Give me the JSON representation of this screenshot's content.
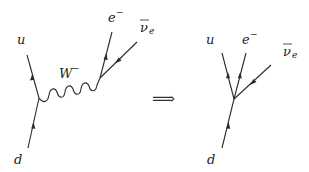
{
  "diagrams": {
    "left": {
      "title": "Beta decay via W boson exchange",
      "labels": {
        "u": "u",
        "d": "d",
        "W": "W",
        "W_charge": "−",
        "e": "e",
        "e_charge": "−",
        "nu": "ν",
        "nu_sub": "e"
      }
    },
    "arrow": "⟹",
    "right": {
      "title": "Effective four-fermion contact interaction",
      "labels": {
        "u": "u",
        "d": "d",
        "e": "e",
        "e_charge": "−",
        "nu": "ν",
        "nu_sub": "e"
      }
    }
  }
}
